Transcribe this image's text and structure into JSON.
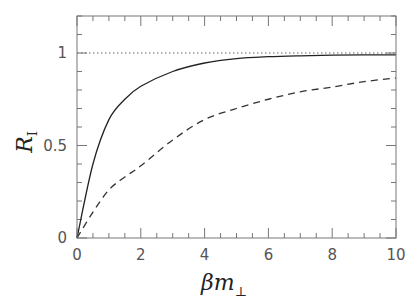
{
  "chart_data": {
    "type": "line",
    "title": "",
    "xlabel": "βm⊥",
    "ylabel": "R_I",
    "xlabel_main": "βm",
    "xlabel_sub": "⊥",
    "ylabel_main": "R",
    "ylabel_sub": "I",
    "xlim": [
      0,
      10
    ],
    "ylim": [
      0,
      1.2
    ],
    "x_ticks": [
      0,
      2,
      4,
      6,
      8,
      10
    ],
    "x_tick_labels": [
      "0",
      "2",
      "4",
      "6",
      "8",
      "10"
    ],
    "y_ticks": [
      0,
      0.5,
      1
    ],
    "y_tick_labels": [
      "0",
      "0.5",
      "1"
    ],
    "x_minor_step": 0.5,
    "y_minor_step": 0.1,
    "grid": false,
    "legend": null,
    "reference_line": {
      "y": 1,
      "style": "dotted"
    },
    "x": [
      0,
      0.5,
      1,
      1.5,
      2,
      3,
      4,
      5,
      6,
      7,
      8,
      9,
      10
    ],
    "series": [
      {
        "name": "solid",
        "style": "solid",
        "values": [
          0,
          0.4,
          0.64,
          0.75,
          0.82,
          0.9,
          0.946,
          0.97,
          0.98,
          0.985,
          0.988,
          0.99,
          0.99
        ]
      },
      {
        "name": "dashed",
        "style": "dashed",
        "values": [
          0,
          0.14,
          0.26,
          0.33,
          0.39,
          0.53,
          0.64,
          0.7,
          0.75,
          0.79,
          0.816,
          0.845,
          0.865
        ]
      }
    ]
  }
}
